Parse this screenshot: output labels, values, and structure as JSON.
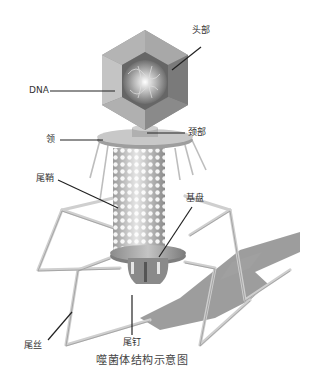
{
  "title": "噬菌体结构示意图",
  "labels": {
    "head": "头部",
    "dna": "DNA",
    "collar": "领",
    "neck": "颈部",
    "sheath": "尾鞘",
    "baseplate": "基盘",
    "tail_fiber": "尾丝",
    "tail_pin": "尾钉"
  },
  "colors": {
    "capsid_outer": "#8f8f8f",
    "capsid_inner": "#6e6e6e",
    "dna_core": "#bdbdbd",
    "sheath": "#cfcfcf",
    "leg": "#d4d4d4",
    "shadow": "#8c8c8c",
    "leader_line": "#222222"
  }
}
